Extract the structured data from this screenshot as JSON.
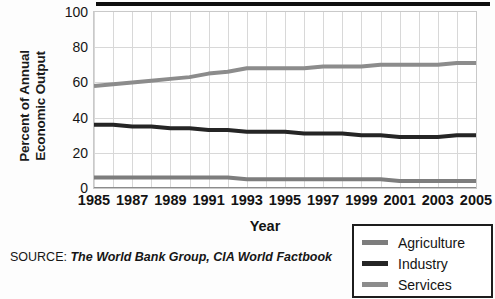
{
  "chart_data": {
    "type": "line",
    "title": "",
    "xlabel": "Year",
    "ylabel": "Percent of Annual Economic Output",
    "x": [
      1985,
      1986,
      1987,
      1988,
      1989,
      1990,
      1991,
      1992,
      1993,
      1994,
      1995,
      1996,
      1997,
      1998,
      1999,
      2000,
      2001,
      2002,
      2003,
      2004,
      2005
    ],
    "xtick_labels": [
      "1985",
      "1987",
      "1989",
      "1991",
      "1993",
      "1995",
      "1997",
      "1999",
      "2001",
      "2003",
      "2005"
    ],
    "xticks": [
      1985,
      1987,
      1989,
      1991,
      1993,
      1995,
      1997,
      1999,
      2001,
      2003,
      2005
    ],
    "ytick_labels": [
      "0",
      "20",
      "40",
      "60",
      "80",
      "100"
    ],
    "yticks": [
      0,
      20,
      40,
      60,
      80,
      100
    ],
    "xlim": [
      1985,
      2005
    ],
    "ylim": [
      0,
      100
    ],
    "grid": true,
    "legend_position": "bottom-right",
    "series": [
      {
        "name": "Agriculture",
        "color": "#7d7d7d",
        "values": [
          6,
          6,
          6,
          6,
          6,
          6,
          6,
          6,
          5,
          5,
          5,
          5,
          5,
          5,
          5,
          5,
          4,
          4,
          4,
          4,
          4
        ]
      },
      {
        "name": "Industry",
        "color": "#252525",
        "values": [
          36,
          36,
          35,
          35,
          34,
          34,
          33,
          33,
          32,
          32,
          32,
          31,
          31,
          31,
          30,
          30,
          29,
          29,
          29,
          30,
          30
        ]
      },
      {
        "name": "Services",
        "color": "#8c8c8c",
        "values": [
          58,
          59,
          60,
          61,
          62,
          63,
          65,
          66,
          68,
          68,
          68,
          68,
          69,
          69,
          69,
          70,
          70,
          70,
          70,
          71,
          71
        ]
      }
    ]
  },
  "axis": {
    "y_title_line1": "Percent of Annual",
    "y_title_line2": "Economic Output",
    "x_title": "Year"
  },
  "source": {
    "label": "SOURCE:",
    "reference": "The World Bank Group, CIA World Factbook"
  },
  "legend": {
    "items": [
      {
        "label": "Agriculture",
        "color": "#7d7d7d"
      },
      {
        "label": "Industry",
        "color": "#252525"
      },
      {
        "label": "Services",
        "color": "#8c8c8c"
      }
    ]
  },
  "colors": {
    "gridline": "#d8d8d8",
    "axis": "#c9c9c9",
    "axis_baseline": "#8c8c8c",
    "title_bar": "#0d0d0d",
    "text": "#131313"
  }
}
